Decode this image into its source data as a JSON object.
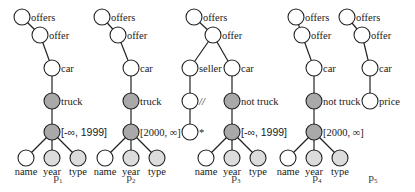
{
  "colors": {
    "node_plain": "#ffffff",
    "node_dark": "#a9a9a9",
    "node_light": "#dcdcdc",
    "stroke": "#222222"
  },
  "patterns": [
    {
      "id": "p1",
      "label": "p",
      "sub": "1",
      "nodes": [
        {
          "id": "a",
          "x": 22,
          "y": 17,
          "fill": "plain",
          "label": "offers"
        },
        {
          "id": "b",
          "x": 40,
          "y": 35,
          "fill": "plain",
          "label": "offer"
        },
        {
          "id": "c",
          "x": 52,
          "y": 68,
          "fill": "plain",
          "label": "car"
        },
        {
          "id": "d",
          "x": 52,
          "y": 101,
          "fill": "dark",
          "label": "truck"
        },
        {
          "id": "e",
          "x": 52,
          "y": 132,
          "fill": "dark",
          "label": "[-∞, 1999]",
          "label_font": "sans"
        },
        {
          "id": "f",
          "x": 26,
          "y": 158,
          "fill": "plain",
          "label": "name",
          "below": true
        },
        {
          "id": "g",
          "x": 52,
          "y": 158,
          "fill": "light",
          "label": "year",
          "below": true
        },
        {
          "id": "h",
          "x": 78,
          "y": 158,
          "fill": "light",
          "label": "type",
          "below": true
        }
      ],
      "edges": [
        [
          "a",
          "b"
        ],
        [
          "b",
          "c"
        ],
        [
          "c",
          "d"
        ],
        [
          "d",
          "e"
        ],
        [
          "e",
          "f"
        ],
        [
          "e",
          "g"
        ],
        [
          "e",
          "h"
        ]
      ],
      "caption_x": 58
    },
    {
      "id": "p2",
      "label": "p",
      "sub": "2",
      "nodes": [
        {
          "id": "a",
          "x": 102,
          "y": 17,
          "fill": "plain",
          "label": "offers"
        },
        {
          "id": "b",
          "x": 118,
          "y": 35,
          "fill": "plain",
          "label": "offer"
        },
        {
          "id": "c",
          "x": 131,
          "y": 68,
          "fill": "plain",
          "label": "car"
        },
        {
          "id": "d",
          "x": 131,
          "y": 101,
          "fill": "dark",
          "label": "truck"
        },
        {
          "id": "e",
          "x": 131,
          "y": 132,
          "fill": "dark",
          "label": "[2000, ∞]"
        },
        {
          "id": "f",
          "x": 105,
          "y": 158,
          "fill": "plain",
          "label": "name",
          "below": true
        },
        {
          "id": "g",
          "x": 131,
          "y": 158,
          "fill": "light",
          "label": "year",
          "below": true
        },
        {
          "id": "h",
          "x": 157,
          "y": 158,
          "fill": "light",
          "label": "type",
          "below": true
        }
      ],
      "edges": [
        [
          "a",
          "b"
        ],
        [
          "b",
          "c"
        ],
        [
          "c",
          "d"
        ],
        [
          "d",
          "e"
        ],
        [
          "e",
          "f"
        ],
        [
          "e",
          "g"
        ],
        [
          "e",
          "h"
        ]
      ],
      "caption_x": 131
    },
    {
      "id": "p3",
      "label": "p",
      "sub": "3",
      "nodes": [
        {
          "id": "a",
          "x": 194,
          "y": 17,
          "fill": "plain",
          "label": "offers"
        },
        {
          "id": "b",
          "x": 213,
          "y": 35,
          "fill": "plain",
          "label": "offer"
        },
        {
          "id": "s",
          "x": 190,
          "y": 68,
          "fill": "plain",
          "label": "seller"
        },
        {
          "id": "c",
          "x": 232,
          "y": 68,
          "fill": "plain",
          "label": "car"
        },
        {
          "id": "t",
          "x": 190,
          "y": 101,
          "fill": "plain",
          "label": "//",
          "label_italic": true
        },
        {
          "id": "d",
          "x": 232,
          "y": 101,
          "fill": "dark",
          "label": "not truck"
        },
        {
          "id": "u",
          "x": 190,
          "y": 132,
          "fill": "plain",
          "label": "*"
        },
        {
          "id": "e",
          "x": 232,
          "y": 132,
          "fill": "dark",
          "label": "[-∞, 1999]",
          "label_font": "sans"
        },
        {
          "id": "f",
          "x": 206,
          "y": 158,
          "fill": "plain",
          "label": "name",
          "below": true
        },
        {
          "id": "g",
          "x": 232,
          "y": 158,
          "fill": "light",
          "label": "year",
          "below": true
        },
        {
          "id": "h",
          "x": 258,
          "y": 158,
          "fill": "light",
          "label": "type",
          "below": true
        }
      ],
      "edges": [
        [
          "a",
          "b"
        ],
        [
          "b",
          "s"
        ],
        [
          "b",
          "c"
        ],
        [
          "s",
          "t"
        ],
        [
          "t",
          "u"
        ],
        [
          "c",
          "d"
        ],
        [
          "d",
          "e"
        ],
        [
          "e",
          "f"
        ],
        [
          "e",
          "g"
        ],
        [
          "e",
          "h"
        ]
      ],
      "caption_x": 236
    },
    {
      "id": "p4",
      "label": "p",
      "sub": "4",
      "nodes": [
        {
          "id": "a",
          "x": 296,
          "y": 17,
          "fill": "plain",
          "label": "offers"
        },
        {
          "id": "b",
          "x": 302,
          "y": 35,
          "fill": "plain",
          "label": "offer"
        },
        {
          "id": "c",
          "x": 314,
          "y": 68,
          "fill": "plain",
          "label": "car"
        },
        {
          "id": "d",
          "x": 314,
          "y": 101,
          "fill": "dark",
          "label": "not truck"
        },
        {
          "id": "e",
          "x": 314,
          "y": 132,
          "fill": "dark",
          "label": "[2000, ∞]"
        },
        {
          "id": "f",
          "x": 288,
          "y": 158,
          "fill": "plain",
          "label": "name",
          "below": true
        },
        {
          "id": "g",
          "x": 314,
          "y": 158,
          "fill": "light",
          "label": "year",
          "below": true
        },
        {
          "id": "h",
          "x": 340,
          "y": 158,
          "fill": "light",
          "label": "type",
          "below": true
        }
      ],
      "edges": [
        [
          "a",
          "b"
        ],
        [
          "b",
          "c"
        ],
        [
          "c",
          "d"
        ],
        [
          "d",
          "e"
        ],
        [
          "e",
          "f"
        ],
        [
          "e",
          "g"
        ],
        [
          "e",
          "h"
        ]
      ],
      "caption_x": 317
    },
    {
      "id": "p5",
      "label": "p",
      "sub": "5",
      "nodes": [
        {
          "id": "a",
          "x": 347,
          "y": 17,
          "fill": "plain",
          "label": "offers"
        },
        {
          "id": "b",
          "x": 362,
          "y": 35,
          "fill": "plain",
          "label": "offer"
        },
        {
          "id": "c",
          "x": 370,
          "y": 68,
          "fill": "plain",
          "label": "car"
        },
        {
          "id": "d",
          "x": 370,
          "y": 101,
          "fill": "plain",
          "label": "price"
        }
      ],
      "edges": [
        [
          "a",
          "b"
        ],
        [
          "b",
          "c"
        ],
        [
          "c",
          "d"
        ]
      ],
      "caption_x": 373
    }
  ],
  "node_radius": 8,
  "caption_y": 181
}
